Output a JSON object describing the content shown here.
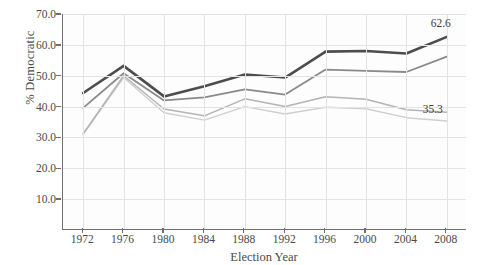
{
  "chart_data": {
    "type": "line",
    "title": "",
    "xlabel": "Election Year",
    "ylabel": "% Democratic",
    "x": [
      1972,
      1976,
      1980,
      1984,
      1988,
      1992,
      1996,
      2000,
      2004,
      2008
    ],
    "categories": [
      "1972",
      "1976",
      "1980",
      "1984",
      "1988",
      "1992",
      "1996",
      "2000",
      "2004",
      "2008"
    ],
    "xlim": [
      1970,
      2010
    ],
    "ylim": [
      0.0,
      70.0
    ],
    "yticks": [
      0.0,
      10.0,
      20.0,
      30.0,
      40.0,
      50.0,
      60.0,
      70.0
    ],
    "ytick_labels": [
      "",
      "10.0",
      "20.0",
      "30.0",
      "40.0",
      "50.0",
      "60.0",
      "70.0"
    ],
    "grid": true,
    "legend": "none",
    "series": [
      {
        "name": "series-1",
        "color": "#4d4d4d",
        "width": 2.6,
        "values": [
          44.4,
          53.2,
          43.3,
          46.6,
          50.4,
          49.4,
          57.8,
          58.0,
          57.2,
          62.6
        ]
      },
      {
        "name": "series-2",
        "color": "#8a8a8a",
        "width": 1.8,
        "values": [
          39.6,
          50.8,
          42.0,
          43.0,
          45.6,
          43.9,
          52.0,
          51.6,
          51.2,
          56.2
        ]
      },
      {
        "name": "series-3",
        "color": "#b4b4b4",
        "width": 1.5,
        "values": [
          31.2,
          50.0,
          39.2,
          37.0,
          42.5,
          40.0,
          43.2,
          42.4,
          39.0,
          38.2
        ]
      },
      {
        "name": "series-4",
        "color": "#cfcfcf",
        "width": 1.4,
        "values": [
          31.0,
          49.4,
          38.0,
          35.6,
          40.0,
          37.6,
          39.8,
          39.3,
          36.4,
          35.3
        ]
      }
    ],
    "annotations": [
      {
        "text": "62.6",
        "x": 2008,
        "y": 62.6,
        "dx": -6,
        "dy": -14,
        "series": "series-1"
      },
      {
        "text": "35.3",
        "x": 2008,
        "y": 35.3,
        "dx": -14,
        "dy": -12,
        "series": "series-4"
      }
    ]
  }
}
